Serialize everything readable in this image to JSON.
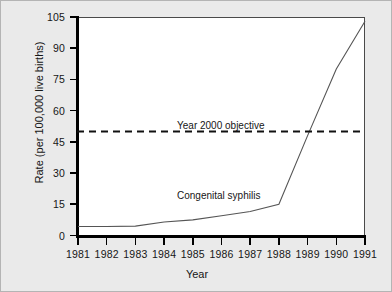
{
  "chart_data": {
    "type": "line",
    "title": "",
    "xlabel": "Year",
    "ylabel": "Rate (per 100,000 live births)",
    "x": [
      1981,
      1982,
      1983,
      1984,
      1985,
      1986,
      1987,
      1988,
      1989,
      1990,
      1991
    ],
    "xtick_labels": [
      "1981",
      "1982",
      "1983",
      "1984",
      "1985",
      "1986",
      "1987",
      "1988",
      "1989",
      "1990",
      "1991"
    ],
    "ytick_labels": [
      "0",
      "15",
      "30",
      "45",
      "60",
      "75",
      "90",
      "105"
    ],
    "ytick_values": [
      0,
      15,
      30,
      45,
      60,
      75,
      90,
      105
    ],
    "ylim": [
      0,
      105
    ],
    "xlim": [
      1981,
      1991
    ],
    "grid": false,
    "legend_position": "inline-annotation",
    "series": [
      {
        "name": "Congenital syphilis",
        "values": [
          4.3,
          4.3,
          4.5,
          6.5,
          7.5,
          9.5,
          11.5,
          15.0,
          48.0,
          80.0,
          103.0
        ],
        "style": "solid",
        "color": "#555555"
      }
    ],
    "reference_lines": [
      {
        "name": "Year 2000 objective",
        "value": 50,
        "style": "dashed",
        "color": "#111111"
      }
    ],
    "annotations": [
      {
        "text": "Year 2000 objective",
        "x": 1986.2,
        "y": 57
      },
      {
        "text": "Congenital syphilis",
        "x": 1986.2,
        "y": 22
      }
    ]
  },
  "labels": {
    "objective": "Year 2000 objective",
    "series": "Congenital syphilis",
    "xaxis": "Year",
    "yaxis": "Rate (per 100,000 live births)"
  }
}
